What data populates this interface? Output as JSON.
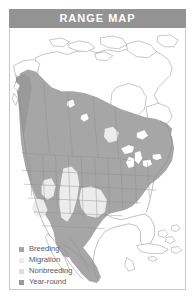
{
  "header": {
    "title": "RANGE MAP",
    "background_color": "#939393",
    "text_color": "#ffffff"
  },
  "map": {
    "name": "north-america-range-map",
    "region": "North America",
    "border_color": "#c8c8c8",
    "ocean_color": "#ffffff",
    "land_outline_color": "#8d8d8d",
    "state_border_color": "#8d8d8d",
    "fills": {
      "breeding": "#a6a6a6",
      "migration": "#ececec",
      "nonbreeding": "#d9d9d9",
      "year_round": "#9a9a9a",
      "unshaded_land": "#ffffff",
      "lakes": "#ffffff"
    }
  },
  "legend": {
    "name": "range-map-legend",
    "items": [
      {
        "label": "Breeding",
        "color": "#a6a6a6"
      },
      {
        "label": "Migration",
        "color": "#ededed"
      },
      {
        "label": "Nonbreeding",
        "color": "#dedede"
      },
      {
        "label": "Year-round",
        "color": "#9a9a9a"
      }
    ]
  }
}
